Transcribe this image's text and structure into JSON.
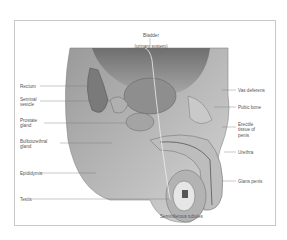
{
  "title": "Bladder",
  "subtitle": "(urinary system)",
  "labels": {
    "rectum": "Rectum",
    "seminal_vesicle": "Seminal\nvesicle",
    "prostate_gland": "Prostate\ngland",
    "bulbourethral_gland": "Bulbourethral\ngland",
    "epididymis": "Epididymis",
    "testis": "Testis",
    "vas_deferens": "Vas deferens",
    "pubic_bone": "Pubic bone",
    "erectile_tissue": "Erectile\ntissue of\npenis",
    "urethra": "Urethra",
    "glans_penis": "Glans penis",
    "seminiferous_tubules": "Seminiferous tubules"
  }
}
